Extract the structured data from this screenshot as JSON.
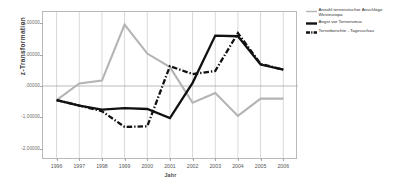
{
  "chart_data": {
    "type": "line",
    "title": "",
    "xlabel": "Jahr",
    "ylabel": "z-Transformation",
    "x": [
      1996,
      1997,
      1998,
      1999,
      2000,
      2001,
      2002,
      2003,
      2004,
      2005,
      2006
    ],
    "categories": [
      "1996",
      "1997",
      "1998",
      "1999",
      "2000",
      "2001",
      "2002",
      "2003",
      "2004",
      "2005",
      "2006"
    ],
    "xlim": [
      1995.4,
      2006.65
    ],
    "ylim": [
      -2.35,
      2.35
    ],
    "ytick_labels": [
      "2,00000",
      "1,00000",
      ",00000",
      "-1,00000",
      "-2,00000"
    ],
    "ytick_values": [
      2.0,
      1.0,
      0.0,
      -1.0,
      -2.0
    ],
    "grid": "vertical-and-zero-line",
    "legend_position": "right-outside",
    "series": [
      {
        "name": "Anzahl terroristischer Anschläge Westeuropa",
        "name_line1": "Anzahl terroristischer Anschläge",
        "name_line2": "Westeuropa",
        "color": "#b4b4b4",
        "style": "solid",
        "width": 2.1,
        "values": [
          -0.45,
          0.08,
          0.17,
          1.95,
          1.03,
          0.6,
          -0.53,
          -0.22,
          -0.95,
          -0.4,
          -0.4
        ]
      },
      {
        "name": "Angst vor Terrorismus",
        "name_line1": "Angst vor Terrorismus",
        "name_line2": "",
        "color": "#111111",
        "style": "solid",
        "width": 2.3,
        "values": [
          -0.45,
          -0.62,
          -0.75,
          -0.7,
          -0.73,
          -1.02,
          0.1,
          1.6,
          1.58,
          0.68,
          0.52
        ]
      },
      {
        "name": "Terrorberichte - Tagesschau",
        "name_line1": "Terrorberichte - Tagesschau",
        "name_line2": "",
        "color": "#111111",
        "style": "dash-dot",
        "width": 2.3,
        "values": [
          -0.45,
          -0.62,
          -0.8,
          -1.3,
          -1.28,
          0.63,
          0.38,
          0.48,
          1.68,
          0.7,
          0.52
        ]
      }
    ]
  },
  "legend": {
    "entries": [
      {
        "label_line1": "Anzahl terroristischer Anschläge",
        "label_line2": "Westeuropa"
      },
      {
        "label_line1": "Angst vor Terrorismus",
        "label_line2": ""
      },
      {
        "label_line1": "Terrorberichte - Tagesschau",
        "label_line2": ""
      }
    ]
  },
  "axes": {
    "y_title": "z-Transformation",
    "x_title": "Jahr"
  }
}
